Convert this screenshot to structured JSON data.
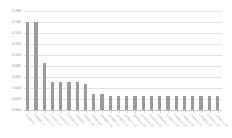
{
  "chart_data": {
    "type": "bar",
    "title": "",
    "subtitle": "",
    "xlabel": "",
    "ylabel": "",
    "ylim": [
      0.0,
      0.18
    ],
    "grid": true,
    "legend": false,
    "legend_position": "none",
    "bar_color": "#9a9a9a",
    "gridline_color": "#e2e2e2",
    "axis_text_color": "#8a8a8a",
    "ytick_labels": [
      "0.180",
      "0.160",
      "0.140",
      "0.120",
      "0.100",
      "0.080",
      "0.060",
      "0.040",
      "0.020",
      "0.000"
    ],
    "ytick_values": [
      0.18,
      0.16,
      0.14,
      0.12,
      0.1,
      0.08,
      0.06,
      0.04,
      0.02,
      0.0
    ],
    "categories": [
      "Category 1",
      "Category 2",
      "Category 3",
      "Category 4",
      "Category 5",
      "Category 6",
      "Category 7",
      "Category 8",
      "Category 9",
      "Category 10",
      "Category 11",
      "Category 12",
      "Category 13",
      "Category 14",
      "Category 15",
      "Category 16",
      "Category 17",
      "Category 18",
      "Category 19",
      "Category 20",
      "Category 21",
      "Category 22",
      "Category 23",
      "Category 24"
    ],
    "values": [
      0.16,
      0.16,
      0.085,
      0.051,
      0.051,
      0.051,
      0.051,
      0.048,
      0.03,
      0.03,
      0.026,
      0.026,
      0.026,
      0.026,
      0.026,
      0.026,
      0.026,
      0.026,
      0.026,
      0.026,
      0.026,
      0.026,
      0.026,
      0.026
    ]
  }
}
